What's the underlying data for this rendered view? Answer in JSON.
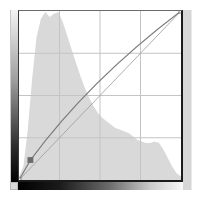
{
  "panel": {
    "type": "curves-adjustment",
    "grid_divisions": 4
  },
  "colors": {
    "histogram_fill": "#d9d9d9",
    "grid_line": "#c4c4c4",
    "curve": "#7a7a7a",
    "baseline": "#9a9a9a",
    "control_point": "#6a6a6a",
    "frame": "#1a1a1a"
  },
  "input_gradient": {
    "direction": "left-to-right",
    "from": "black",
    "to": "white"
  },
  "output_gradient": {
    "direction": "bottom-to-top",
    "from": "black",
    "to": "white"
  },
  "curve": {
    "points": [
      {
        "input": 0,
        "output": 0
      },
      {
        "input": 18,
        "output": 30
      },
      {
        "input": 255,
        "output": 255
      }
    ],
    "selected_point_index": 1
  },
  "histogram": {
    "bins": [
      2,
      8,
      30,
      60,
      85,
      96,
      100,
      97,
      99,
      100,
      94,
      86,
      78,
      70,
      62,
      55,
      49,
      44,
      40,
      37,
      35,
      33,
      31,
      30,
      29,
      28,
      26,
      24,
      23,
      22,
      22,
      23,
      22,
      18,
      13,
      8,
      4,
      2
    ]
  }
}
